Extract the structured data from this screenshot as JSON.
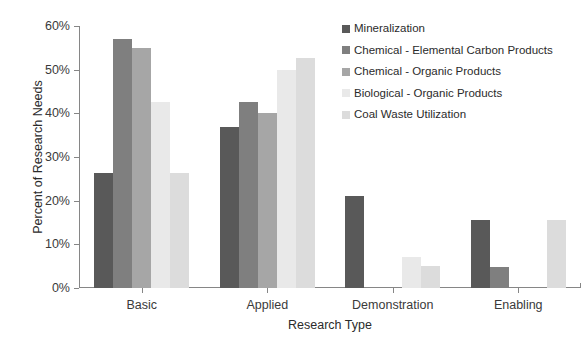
{
  "chart_data": {
    "type": "bar",
    "title": "",
    "subtitle": "",
    "xlabel": "Research Type",
    "ylabel": "Percent of Research Needs",
    "categories": [
      "Basic",
      "Applied",
      "Demonstration",
      "Enabling"
    ],
    "ylim": [
      0,
      60
    ],
    "yticks": [
      0,
      10,
      20,
      30,
      40,
      50,
      60
    ],
    "ytick_labels": [
      "0%",
      "10%",
      "20%",
      "30%",
      "40%",
      "50%",
      "60%"
    ],
    "grid": false,
    "legend_position": "upper right (inside plot)",
    "series": [
      {
        "name": "Mineralization",
        "color": "#595959",
        "values": [
          26.3,
          36.8,
          21.0,
          15.6
        ]
      },
      {
        "name": "Chemical - Elemental Carbon Products",
        "color": "#7f7f7f",
        "values": [
          57.0,
          42.7,
          0,
          4.9
        ]
      },
      {
        "name": "Chemical - Organic Products",
        "color": "#a6a6a6",
        "values": [
          55.0,
          40.0,
          0,
          0
        ]
      },
      {
        "name": "Biological - Organic Products",
        "color": "#e9e9e9",
        "values": [
          42.7,
          50.0,
          7.0,
          0
        ]
      },
      {
        "name": "Coal Waste Utilization",
        "color": "#dcdcdc",
        "values": [
          26.3,
          52.6,
          5.1,
          15.6
        ]
      }
    ]
  },
  "legend": {
    "entries": [
      "Mineralization",
      "Chemical - Elemental Carbon Products",
      "Chemical - Organic Products",
      "Biological - Organic Products",
      "Coal Waste Utilization"
    ]
  },
  "axes": {
    "y_title": "Percent of Research Needs",
    "x_title": "Research Type"
  }
}
